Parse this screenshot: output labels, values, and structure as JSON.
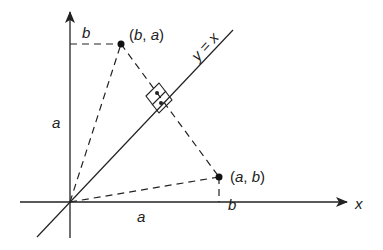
{
  "diagram": {
    "axes": {
      "x_label": "x",
      "y_label_hidden": true
    },
    "line": {
      "label": "y = x"
    },
    "points": [
      {
        "label_open": "(",
        "label_a": "b",
        "label_sep": ", ",
        "label_b": "a",
        "label_close": ")",
        "coords": "(b, a)"
      },
      {
        "label_open": "(",
        "label_a": "a",
        "label_sep": ", ",
        "label_b": "b",
        "label_close": ")",
        "coords": "(a, b)"
      }
    ],
    "segment_labels": {
      "top_horizontal": "b",
      "left_vertical": "a",
      "right_vertical": "b",
      "bottom_horizontal": "a"
    },
    "colors": {
      "stroke": "#222222",
      "background": "#ffffff"
    }
  }
}
